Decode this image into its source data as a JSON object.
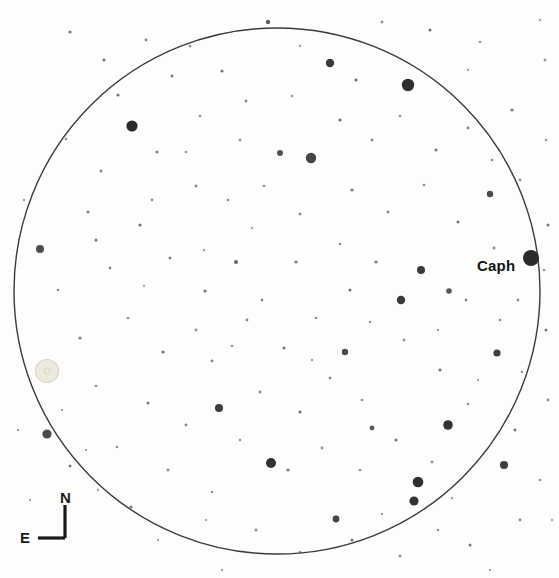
{
  "chart_data": {
    "type": "scatter",
    "title": "",
    "xlabel": "",
    "ylabel": "",
    "background_color": "#fdfdfd",
    "field_circle": {
      "center_x": 277,
      "center_y": 291,
      "radius": 263,
      "stroke": "#3a3a3a",
      "stroke_width": 1.4,
      "fill": "none"
    },
    "labeled_stars": [
      {
        "name": "Caph",
        "x": 531,
        "y": 258,
        "r": 8.0,
        "color": "#2b2b2b",
        "label_dx": -54,
        "label_dy": -1
      }
    ],
    "target_object": {
      "name": "comet-marker",
      "x": 47,
      "y": 371,
      "outer_r": 11.5,
      "inner_r": 3.0,
      "outer_color": "#ece9dd",
      "inner_color": "#d8d4c4"
    },
    "faint_side_text": "",
    "stars": [
      {
        "x": 408,
        "y": 85,
        "r": 6.2,
        "c": "#2e2e2e"
      },
      {
        "x": 132,
        "y": 126,
        "r": 5.6,
        "c": "#2b2b2b"
      },
      {
        "x": 311,
        "y": 158,
        "r": 5.2,
        "c": "#444444"
      },
      {
        "x": 330,
        "y": 63,
        "r": 4.2,
        "c": "#3a3a3a"
      },
      {
        "x": 421,
        "y": 270,
        "r": 4.0,
        "c": "#3b3b3b"
      },
      {
        "x": 490,
        "y": 194,
        "r": 3.2,
        "c": "#4a4a4a"
      },
      {
        "x": 280,
        "y": 153,
        "r": 3.0,
        "c": "#4f4f4f"
      },
      {
        "x": 418,
        "y": 482,
        "r": 5.3,
        "c": "#2f2f2f"
      },
      {
        "x": 448,
        "y": 425,
        "r": 4.8,
        "c": "#333333"
      },
      {
        "x": 271,
        "y": 463,
        "r": 5.0,
        "c": "#313131"
      },
      {
        "x": 414,
        "y": 501,
        "r": 4.6,
        "c": "#343434"
      },
      {
        "x": 401,
        "y": 300,
        "r": 4.2,
        "c": "#3a3a3a"
      },
      {
        "x": 219,
        "y": 408,
        "r": 4.0,
        "c": "#3d3d3d"
      },
      {
        "x": 47,
        "y": 434,
        "r": 4.6,
        "c": "#4b4b4b"
      },
      {
        "x": 40,
        "y": 249,
        "r": 4.0,
        "c": "#4d4d4d"
      },
      {
        "x": 504,
        "y": 465,
        "r": 4.0,
        "c": "#3d3d3d"
      },
      {
        "x": 497,
        "y": 353,
        "r": 3.6,
        "c": "#3f3f3f"
      },
      {
        "x": 345,
        "y": 352,
        "r": 3.2,
        "c": "#4a4a4a"
      },
      {
        "x": 336,
        "y": 519,
        "r": 3.4,
        "c": "#444444"
      },
      {
        "x": 449,
        "y": 291,
        "r": 2.8,
        "c": "#555555"
      },
      {
        "x": 372,
        "y": 428,
        "r": 2.4,
        "c": "#5a5a5a"
      },
      {
        "x": 236,
        "y": 262,
        "r": 2.0,
        "c": "#666666"
      },
      {
        "x": 70,
        "y": 32,
        "r": 1.6,
        "c": "#7a7a7a"
      },
      {
        "x": 146,
        "y": 40,
        "r": 1.4,
        "c": "#808080"
      },
      {
        "x": 268,
        "y": 22,
        "r": 2.2,
        "c": "#5e5e5e"
      },
      {
        "x": 190,
        "y": 46,
        "r": 1.3,
        "c": "#8a8a8a"
      },
      {
        "x": 222,
        "y": 71,
        "r": 1.6,
        "c": "#777777"
      },
      {
        "x": 172,
        "y": 76,
        "r": 1.5,
        "c": "#7d7d7d"
      },
      {
        "x": 246,
        "y": 101,
        "r": 1.4,
        "c": "#828282"
      },
      {
        "x": 118,
        "y": 95,
        "r": 1.6,
        "c": "#767676"
      },
      {
        "x": 200,
        "y": 116,
        "r": 1.3,
        "c": "#8b8b8b"
      },
      {
        "x": 157,
        "y": 152,
        "r": 1.5,
        "c": "#7e7e7e"
      },
      {
        "x": 101,
        "y": 171,
        "r": 1.4,
        "c": "#848484"
      },
      {
        "x": 66,
        "y": 139,
        "r": 1.3,
        "c": "#8c8c8c"
      },
      {
        "x": 88,
        "y": 212,
        "r": 1.5,
        "c": "#7f7f7f"
      },
      {
        "x": 140,
        "y": 225,
        "r": 1.6,
        "c": "#757575"
      },
      {
        "x": 196,
        "y": 186,
        "r": 1.4,
        "c": "#858585"
      },
      {
        "x": 228,
        "y": 200,
        "r": 1.3,
        "c": "#8d8d8d"
      },
      {
        "x": 170,
        "y": 258,
        "r": 1.5,
        "c": "#7c7c7c"
      },
      {
        "x": 110,
        "y": 268,
        "r": 1.4,
        "c": "#868686"
      },
      {
        "x": 58,
        "y": 290,
        "r": 1.3,
        "c": "#8e8e8e"
      },
      {
        "x": 205,
        "y": 291,
        "r": 1.6,
        "c": "#747474"
      },
      {
        "x": 247,
        "y": 320,
        "r": 1.4,
        "c": "#878787"
      },
      {
        "x": 128,
        "y": 318,
        "r": 1.3,
        "c": "#8f8f8f"
      },
      {
        "x": 80,
        "y": 338,
        "r": 1.5,
        "c": "#7b7b7b"
      },
      {
        "x": 163,
        "y": 352,
        "r": 1.6,
        "c": "#737373"
      },
      {
        "x": 212,
        "y": 361,
        "r": 1.4,
        "c": "#888888"
      },
      {
        "x": 96,
        "y": 386,
        "r": 1.3,
        "c": "#909090"
      },
      {
        "x": 148,
        "y": 403,
        "r": 1.5,
        "c": "#7a7a7a"
      },
      {
        "x": 186,
        "y": 425,
        "r": 1.4,
        "c": "#898989"
      },
      {
        "x": 117,
        "y": 447,
        "r": 1.3,
        "c": "#919191"
      },
      {
        "x": 70,
        "y": 466,
        "r": 1.5,
        "c": "#797979"
      },
      {
        "x": 168,
        "y": 470,
        "r": 1.4,
        "c": "#8a8a8a"
      },
      {
        "x": 212,
        "y": 492,
        "r": 1.3,
        "c": "#929292"
      },
      {
        "x": 131,
        "y": 507,
        "r": 1.5,
        "c": "#787878"
      },
      {
        "x": 256,
        "y": 530,
        "r": 1.4,
        "c": "#8b8b8b"
      },
      {
        "x": 300,
        "y": 552,
        "r": 1.3,
        "c": "#939393"
      },
      {
        "x": 352,
        "y": 540,
        "r": 1.5,
        "c": "#777777"
      },
      {
        "x": 400,
        "y": 556,
        "r": 1.4,
        "c": "#8c8c8c"
      },
      {
        "x": 438,
        "y": 530,
        "r": 1.3,
        "c": "#949494"
      },
      {
        "x": 470,
        "y": 545,
        "r": 1.5,
        "c": "#767676"
      },
      {
        "x": 520,
        "y": 520,
        "r": 1.4,
        "c": "#8d8d8d"
      },
      {
        "x": 540,
        "y": 480,
        "r": 1.3,
        "c": "#959595"
      },
      {
        "x": 515,
        "y": 430,
        "r": 1.5,
        "c": "#757575"
      },
      {
        "x": 548,
        "y": 400,
        "r": 1.4,
        "c": "#8e8e8e"
      },
      {
        "x": 522,
        "y": 372,
        "r": 1.3,
        "c": "#969696"
      },
      {
        "x": 546,
        "y": 330,
        "r": 1.5,
        "c": "#747474"
      },
      {
        "x": 518,
        "y": 300,
        "r": 1.4,
        "c": "#8f8f8f"
      },
      {
        "x": 544,
        "y": 270,
        "r": 1.3,
        "c": "#979797"
      },
      {
        "x": 548,
        "y": 225,
        "r": 1.5,
        "c": "#737373"
      },
      {
        "x": 520,
        "y": 180,
        "r": 1.4,
        "c": "#909090"
      },
      {
        "x": 546,
        "y": 140,
        "r": 1.3,
        "c": "#989898"
      },
      {
        "x": 512,
        "y": 110,
        "r": 1.5,
        "c": "#727272"
      },
      {
        "x": 545,
        "y": 60,
        "r": 1.4,
        "c": "#919191"
      },
      {
        "x": 480,
        "y": 42,
        "r": 1.3,
        "c": "#999999"
      },
      {
        "x": 430,
        "y": 30,
        "r": 1.5,
        "c": "#717171"
      },
      {
        "x": 382,
        "y": 22,
        "r": 1.4,
        "c": "#929292"
      },
      {
        "x": 340,
        "y": 120,
        "r": 1.6,
        "c": "#6f6f6f"
      },
      {
        "x": 372,
        "y": 140,
        "r": 1.4,
        "c": "#858585"
      },
      {
        "x": 400,
        "y": 116,
        "r": 1.3,
        "c": "#8d8d8d"
      },
      {
        "x": 436,
        "y": 150,
        "r": 1.5,
        "c": "#787878"
      },
      {
        "x": 468,
        "y": 128,
        "r": 1.4,
        "c": "#868686"
      },
      {
        "x": 492,
        "y": 160,
        "r": 1.3,
        "c": "#8e8e8e"
      },
      {
        "x": 352,
        "y": 190,
        "r": 1.5,
        "c": "#777777"
      },
      {
        "x": 388,
        "y": 212,
        "r": 1.4,
        "c": "#878787"
      },
      {
        "x": 424,
        "y": 185,
        "r": 1.3,
        "c": "#8f8f8f"
      },
      {
        "x": 458,
        "y": 222,
        "r": 1.5,
        "c": "#767676"
      },
      {
        "x": 494,
        "y": 248,
        "r": 1.4,
        "c": "#888888"
      },
      {
        "x": 340,
        "y": 244,
        "r": 1.3,
        "c": "#909090"
      },
      {
        "x": 376,
        "y": 262,
        "r": 1.5,
        "c": "#757575"
      },
      {
        "x": 466,
        "y": 300,
        "r": 1.4,
        "c": "#898989"
      },
      {
        "x": 500,
        "y": 320,
        "r": 1.3,
        "c": "#919191"
      },
      {
        "x": 300,
        "y": 214,
        "r": 1.4,
        "c": "#898989"
      },
      {
        "x": 264,
        "y": 186,
        "r": 1.3,
        "c": "#919191"
      },
      {
        "x": 296,
        "y": 262,
        "r": 1.5,
        "c": "#747474"
      },
      {
        "x": 262,
        "y": 300,
        "r": 1.4,
        "c": "#8a8a8a"
      },
      {
        "x": 316,
        "y": 318,
        "r": 1.3,
        "c": "#929292"
      },
      {
        "x": 284,
        "y": 348,
        "r": 1.5,
        "c": "#737373"
      },
      {
        "x": 330,
        "y": 378,
        "r": 1.4,
        "c": "#8b8b8b"
      },
      {
        "x": 362,
        "y": 400,
        "r": 1.3,
        "c": "#939393"
      },
      {
        "x": 300,
        "y": 412,
        "r": 1.5,
        "c": "#727272"
      },
      {
        "x": 260,
        "y": 392,
        "r": 1.4,
        "c": "#8c8c8c"
      },
      {
        "x": 240,
        "y": 440,
        "r": 1.3,
        "c": "#949494"
      },
      {
        "x": 288,
        "y": 470,
        "r": 1.5,
        "c": "#717171"
      },
      {
        "x": 322,
        "y": 448,
        "r": 1.4,
        "c": "#8d8d8d"
      },
      {
        "x": 360,
        "y": 470,
        "r": 1.3,
        "c": "#959595"
      },
      {
        "x": 396,
        "y": 440,
        "r": 1.5,
        "c": "#707070"
      },
      {
        "x": 432,
        "y": 462,
        "r": 1.4,
        "c": "#8e8e8e"
      },
      {
        "x": 468,
        "y": 404,
        "r": 1.3,
        "c": "#969696"
      },
      {
        "x": 440,
        "y": 370,
        "r": 1.5,
        "c": "#6f6f6f"
      },
      {
        "x": 404,
        "y": 340,
        "r": 1.4,
        "c": "#8f8f8f"
      },
      {
        "x": 370,
        "y": 322,
        "r": 1.3,
        "c": "#979797"
      },
      {
        "x": 350,
        "y": 290,
        "r": 1.5,
        "c": "#6e6e6e"
      },
      {
        "x": 196,
        "y": 330,
        "r": 1.4,
        "c": "#909090"
      },
      {
        "x": 232,
        "y": 346,
        "r": 1.3,
        "c": "#989898"
      },
      {
        "x": 96,
        "y": 240,
        "r": 1.5,
        "c": "#6d6d6d"
      },
      {
        "x": 152,
        "y": 200,
        "r": 1.4,
        "c": "#919191"
      },
      {
        "x": 186,
        "y": 152,
        "r": 1.3,
        "c": "#999999"
      },
      {
        "x": 104,
        "y": 60,
        "r": 1.5,
        "c": "#6c6c6c"
      },
      {
        "x": 240,
        "y": 140,
        "r": 1.4,
        "c": "#929292"
      },
      {
        "x": 292,
        "y": 96,
        "r": 1.3,
        "c": "#9a9a9a"
      },
      {
        "x": 356,
        "y": 80,
        "r": 1.5,
        "c": "#6b6b6b"
      },
      {
        "x": 204,
        "y": 250,
        "r": 1.2,
        "c": "#a0a0a0"
      },
      {
        "x": 144,
        "y": 286,
        "r": 1.2,
        "c": "#a2a2a2"
      },
      {
        "x": 252,
        "y": 228,
        "r": 1.2,
        "c": "#a4a4a4"
      },
      {
        "x": 312,
        "y": 360,
        "r": 1.2,
        "c": "#a1a1a1"
      },
      {
        "x": 438,
        "y": 330,
        "r": 1.2,
        "c": "#a3a3a3"
      },
      {
        "x": 478,
        "y": 380,
        "r": 1.2,
        "c": "#a5a5a5"
      },
      {
        "x": 382,
        "y": 514,
        "r": 1.2,
        "c": "#a0a0a0"
      },
      {
        "x": 452,
        "y": 498,
        "r": 1.2,
        "c": "#a2a2a2"
      },
      {
        "x": 206,
        "y": 520,
        "r": 1.2,
        "c": "#a4a4a4"
      },
      {
        "x": 158,
        "y": 540,
        "r": 1.2,
        "c": "#a6a6a6"
      },
      {
        "x": 24,
        "y": 200,
        "r": 1.2,
        "c": "#a1a1a1"
      },
      {
        "x": 18,
        "y": 430,
        "r": 1.2,
        "c": "#a3a3a3"
      },
      {
        "x": 30,
        "y": 500,
        "r": 1.2,
        "c": "#a5a5a5"
      },
      {
        "x": 540,
        "y": 20,
        "r": 1.2,
        "c": "#a0a0a0"
      },
      {
        "x": 300,
        "y": 46,
        "r": 1.2,
        "c": "#a2a2a2"
      },
      {
        "x": 468,
        "y": 70,
        "r": 1.2,
        "c": "#a4a4a4"
      },
      {
        "x": 86,
        "y": 450,
        "r": 1.2,
        "c": "#a6a6a6"
      },
      {
        "x": 62,
        "y": 410,
        "r": 1.2,
        "c": "#a7a7a7"
      },
      {
        "x": 98,
        "y": 490,
        "r": 1.2,
        "c": "#a8a8a8"
      },
      {
        "x": 222,
        "y": 570,
        "r": 1.2,
        "c": "#a9a9a9"
      },
      {
        "x": 490,
        "y": 570,
        "r": 1.2,
        "c": "#a5a5a5"
      },
      {
        "x": 552,
        "y": 520,
        "r": 1.2,
        "c": "#a7a7a7"
      }
    ]
  },
  "compass": {
    "north_label": "N",
    "east_label": "E",
    "vertex_x": 65,
    "vertex_y": 538,
    "north_tip_y": 505,
    "east_tip_x": 38,
    "stroke": "#1a1a1a",
    "stroke_width": 3.2
  },
  "caph": {
    "label": "Caph"
  }
}
